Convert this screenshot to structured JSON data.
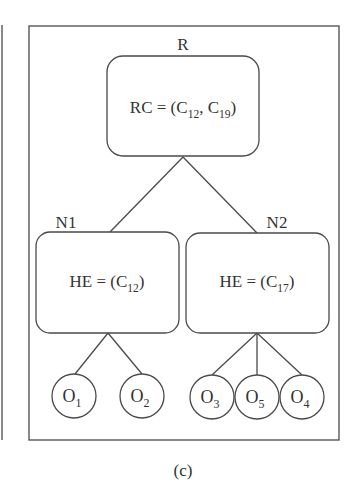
{
  "figure": {
    "caption": "(c)",
    "root": {
      "label": "R",
      "content": {
        "prefix": "RC = (",
        "items": [
          {
            "base": "C",
            "sub": "12"
          },
          {
            "base": "C",
            "sub": "19"
          }
        ],
        "suffix": ")"
      }
    },
    "nodes": [
      {
        "label": "N1",
        "content": {
          "prefix": "HE = (",
          "items": [
            {
              "base": "C",
              "sub": "12"
            }
          ],
          "suffix": ")"
        },
        "leaves": [
          {
            "base": "O",
            "sub": "1"
          },
          {
            "base": "O",
            "sub": "2"
          }
        ]
      },
      {
        "label": "N2",
        "content": {
          "prefix": "HE = (",
          "items": [
            {
              "base": "C",
              "sub": "17"
            }
          ],
          "suffix": ")"
        },
        "leaves": [
          {
            "base": "O",
            "sub": "3"
          },
          {
            "base": "O",
            "sub": "5"
          },
          {
            "base": "O",
            "sub": "4"
          }
        ]
      }
    ],
    "colors": {
      "line": "#4a4a4a",
      "text": "#333333",
      "background": "#ffffff"
    }
  }
}
